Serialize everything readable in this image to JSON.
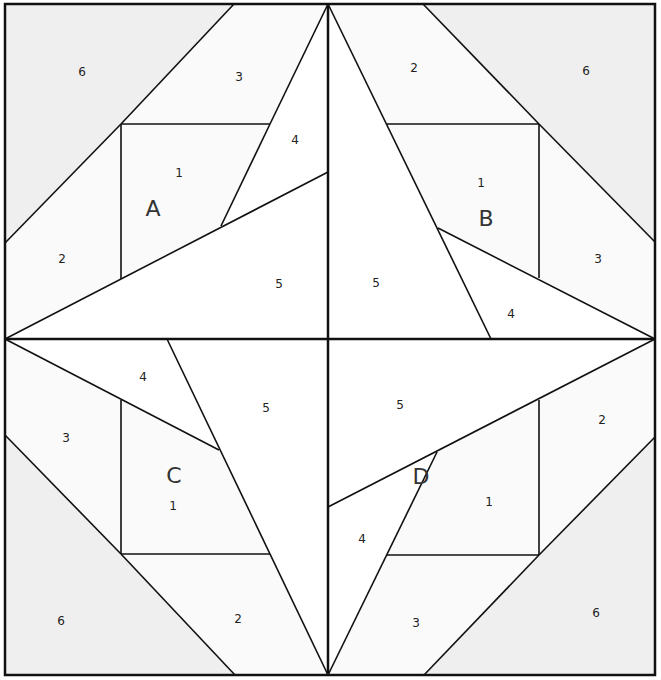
{
  "colors": {
    "shaded": "#efefef",
    "light": "#fafafa",
    "white": "#ffffff",
    "line": "#111111"
  },
  "frame": {
    "x1": 5,
    "y1": 4,
    "x2": 655,
    "y2": 675,
    "cx": 328,
    "cy": 339
  },
  "regions": [
    {
      "id": "A6",
      "fill": "shaded",
      "points": "5,4 234,4 121,124 5,243"
    },
    {
      "id": "A3",
      "fill": "light",
      "points": "234,4 328,4 270,124 121,124"
    },
    {
      "id": "A2",
      "fill": "light",
      "points": "5,243 121,124 121,279 5,339"
    },
    {
      "id": "A1",
      "fill": "light",
      "points": "121,124 270,124 221,226 121,279"
    },
    {
      "id": "A4",
      "fill": "white",
      "points": "270,124 328,4 328,172 221,226"
    },
    {
      "id": "A5",
      "fill": "white",
      "points": "5,339 328,172 328,339"
    },
    {
      "id": "B6",
      "fill": "shaded",
      "points": "423,4 655,4 655,242 539,124"
    },
    {
      "id": "B2",
      "fill": "light",
      "points": "328,4 423,4 539,124 387,124"
    },
    {
      "id": "B3",
      "fill": "light",
      "points": "539,124 655,242 655,339 539,278"
    },
    {
      "id": "B1",
      "fill": "light",
      "points": "387,124 539,124 539,278 438,228"
    },
    {
      "id": "B5",
      "fill": "white",
      "points": "328,4 491,339 328,339"
    },
    {
      "id": "B4",
      "fill": "white",
      "points": "438,228 655,339 491,339"
    },
    {
      "id": "C6",
      "fill": "shaded",
      "points": "5,435 121,554 235,675 5,675"
    },
    {
      "id": "C3",
      "fill": "light",
      "points": "5,339 121,400 121,554 5,435"
    },
    {
      "id": "C2",
      "fill": "light",
      "points": "121,554 270,554 328,675 235,675"
    },
    {
      "id": "C1",
      "fill": "light",
      "points": "121,400 219,450 270,554 121,554"
    },
    {
      "id": "C4",
      "fill": "white",
      "points": "5,339 167,339 219,450"
    },
    {
      "id": "C5",
      "fill": "white",
      "points": "167,339 328,339 328,675"
    },
    {
      "id": "D6",
      "fill": "shaded",
      "points": "655,437 655,675 424,675 539,555"
    },
    {
      "id": "D2",
      "fill": "light",
      "points": "539,400 655,339 655,437 539,555"
    },
    {
      "id": "D3",
      "fill": "light",
      "points": "387,555 539,555 424,675 328,675"
    },
    {
      "id": "D1",
      "fill": "light",
      "points": "437,452 539,400 539,555 387,555"
    },
    {
      "id": "D5",
      "fill": "white",
      "points": "328,339 655,339 328,507"
    },
    {
      "id": "D4",
      "fill": "white",
      "points": "328,507 437,452 328,675"
    }
  ],
  "lines": [
    [
      234,
      4,
      121,
      124
    ],
    [
      121,
      124,
      5,
      243
    ],
    [
      121,
      124,
      270,
      124
    ],
    [
      121,
      124,
      121,
      279
    ],
    [
      270,
      124,
      328,
      4
    ],
    [
      270,
      124,
      221,
      226
    ],
    [
      5,
      339,
      328,
      172
    ],
    [
      423,
      4,
      539,
      124
    ],
    [
      539,
      124,
      655,
      242
    ],
    [
      387,
      124,
      539,
      124
    ],
    [
      539,
      124,
      539,
      278
    ],
    [
      328,
      4,
      491,
      339
    ],
    [
      438,
      228,
      655,
      339
    ],
    [
      5,
      435,
      121,
      554
    ],
    [
      121,
      554,
      235,
      675
    ],
    [
      121,
      400,
      121,
      554
    ],
    [
      121,
      554,
      270,
      554
    ],
    [
      5,
      339,
      219,
      450
    ],
    [
      167,
      339,
      328,
      675
    ],
    [
      655,
      437,
      539,
      555
    ],
    [
      539,
      555,
      424,
      675
    ],
    [
      539,
      400,
      539,
      555
    ],
    [
      387,
      555,
      539,
      555
    ],
    [
      328,
      507,
      655,
      339
    ],
    [
      437,
      452,
      328,
      675
    ]
  ],
  "labels": [
    {
      "text": "6",
      "x": 82,
      "y": 72
    },
    {
      "text": "3",
      "x": 239,
      "y": 77
    },
    {
      "text": "4",
      "x": 295,
      "y": 140
    },
    {
      "text": "1",
      "x": 179,
      "y": 173
    },
    {
      "text": "2",
      "x": 62,
      "y": 259
    },
    {
      "text": "5",
      "x": 279,
      "y": 284
    },
    {
      "text": "2",
      "x": 414,
      "y": 68
    },
    {
      "text": "6",
      "x": 586,
      "y": 71
    },
    {
      "text": "1",
      "x": 481,
      "y": 183
    },
    {
      "text": "3",
      "x": 598,
      "y": 259
    },
    {
      "text": "5",
      "x": 376,
      "y": 283
    },
    {
      "text": "4",
      "x": 511,
      "y": 314
    },
    {
      "text": "4",
      "x": 143,
      "y": 377
    },
    {
      "text": "5",
      "x": 266,
      "y": 408
    },
    {
      "text": "3",
      "x": 66,
      "y": 438
    },
    {
      "text": "1",
      "x": 173,
      "y": 506
    },
    {
      "text": "6",
      "x": 61,
      "y": 621
    },
    {
      "text": "2",
      "x": 238,
      "y": 619
    },
    {
      "text": "5",
      "x": 400,
      "y": 405
    },
    {
      "text": "2",
      "x": 602,
      "y": 420
    },
    {
      "text": "1",
      "x": 489,
      "y": 502
    },
    {
      "text": "4",
      "x": 362,
      "y": 539
    },
    {
      "text": "3",
      "x": 416,
      "y": 623
    },
    {
      "text": "6",
      "x": 596,
      "y": 613
    }
  ],
  "block_labels": [
    {
      "text": "A",
      "x": 153,
      "y": 209
    },
    {
      "text": "B",
      "x": 486,
      "y": 219
    },
    {
      "text": "C",
      "x": 174,
      "y": 476
    },
    {
      "text": "D",
      "x": 421,
      "y": 477
    }
  ]
}
